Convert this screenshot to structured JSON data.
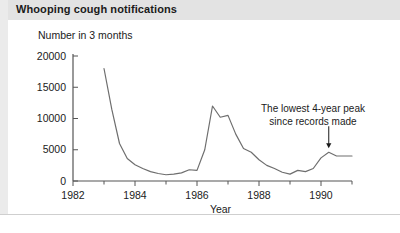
{
  "header": {
    "title": "Whooping cough notifications"
  },
  "annotation": {
    "line1": "The lowest 4-year peak",
    "line2": "since records made"
  },
  "chart_data": {
    "type": "line",
    "title": "Whooping cough notifications",
    "xlabel": "Year",
    "ylabel": "Number in 3 months",
    "ylim": [
      0,
      20000
    ],
    "xlim": [
      1982,
      1991
    ],
    "grid": false,
    "legend": false,
    "yticks": [
      0,
      5000,
      10000,
      15000,
      20000
    ],
    "ytick_labels": [
      "0",
      "5000",
      "10000",
      "15000",
      "20000"
    ],
    "xticks": [
      1982,
      1984,
      1986,
      1988,
      1990
    ],
    "xtick_labels": [
      "1982",
      "1984",
      "1986",
      "1988",
      "1990"
    ],
    "x_minor_ticks": [
      1983,
      1985,
      1987,
      1989,
      1991
    ],
    "series": [
      {
        "name": "Whooping cough notifications",
        "color": "#6e6e6e",
        "x": [
          1983.0,
          1983.25,
          1983.5,
          1983.75,
          1984.0,
          1984.25,
          1984.5,
          1984.75,
          1985.0,
          1985.25,
          1985.5,
          1985.75,
          1986.0,
          1986.25,
          1986.5,
          1986.75,
          1987.0,
          1987.25,
          1987.5,
          1987.75,
          1988.0,
          1988.25,
          1988.5,
          1988.75,
          1989.0,
          1989.25,
          1989.5,
          1989.75,
          1990.0,
          1990.25,
          1990.5,
          1991.0
        ],
        "y": [
          18000,
          11500,
          6000,
          3600,
          2600,
          2000,
          1500,
          1200,
          1000,
          1100,
          1300,
          1800,
          1700,
          5000,
          12000,
          10200,
          10500,
          7500,
          5200,
          4600,
          3400,
          2500,
          2000,
          1400,
          1100,
          1700,
          1500,
          2000,
          3700,
          4600,
          4000,
          4000
        ]
      }
    ],
    "annotations": [
      {
        "text": "The lowest 4-year peak since records made",
        "x": 1990.25,
        "y": 4600,
        "arrow": "down"
      }
    ]
  }
}
